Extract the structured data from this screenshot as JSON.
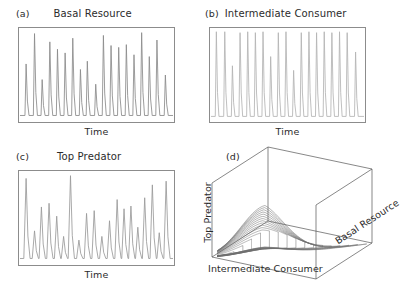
{
  "figure": {
    "background_color": "#ffffff",
    "frame_color": "#8c8c8c"
  },
  "panels": {
    "a": {
      "tag": "(a)",
      "title": "Basal Resource",
      "xlabel": "Time"
    },
    "b": {
      "tag": "(b)",
      "title": "Intermediate Consumer",
      "xlabel": "Time"
    },
    "c": {
      "tag": "(c)",
      "title": "Top Predator",
      "xlabel": "Time"
    },
    "d": {
      "tag": "(d)",
      "zlabel": "Top Predator",
      "xlabel": "Intermediate Consumer",
      "ylabel": "Basal Resource"
    }
  },
  "chart_data": [
    {
      "id": "panel-a",
      "type": "line",
      "title": "Basal Resource",
      "xlabel": "Time",
      "ylabel": "",
      "series_color": "#8a8a8a",
      "grid": false,
      "legend": "none",
      "xlim": [
        0,
        100
      ],
      "ylim": [
        0,
        1
      ],
      "description": "Chaotic spiky time series of basal resource density; narrow sharp peaks of varying height rising from a low flat baseline.",
      "peaks": [
        {
          "x": 4.0,
          "height": 0.62
        },
        {
          "x": 9.5,
          "height": 0.95
        },
        {
          "x": 14.5,
          "height": 0.45
        },
        {
          "x": 19.5,
          "height": 0.86
        },
        {
          "x": 24.5,
          "height": 0.78
        },
        {
          "x": 29.5,
          "height": 0.74
        },
        {
          "x": 34.5,
          "height": 0.9
        },
        {
          "x": 39.5,
          "height": 0.56
        },
        {
          "x": 44.0,
          "height": 0.65
        },
        {
          "x": 49.5,
          "height": 0.4
        },
        {
          "x": 54.5,
          "height": 0.93
        },
        {
          "x": 59.5,
          "height": 0.82
        },
        {
          "x": 64.5,
          "height": 0.8
        },
        {
          "x": 69.5,
          "height": 0.83
        },
        {
          "x": 74.5,
          "height": 0.72
        },
        {
          "x": 79.5,
          "height": 0.96
        },
        {
          "x": 84.5,
          "height": 0.7
        },
        {
          "x": 89.5,
          "height": 0.88
        },
        {
          "x": 95.0,
          "height": 0.5
        }
      ],
      "baseline": 0.06
    },
    {
      "id": "panel-b",
      "type": "line",
      "title": "Intermediate Consumer",
      "xlabel": "Time",
      "ylabel": "",
      "series_color": "#b4b4b4",
      "grid": false,
      "legend": "none",
      "xlim": [
        0,
        100
      ],
      "ylim": [
        0,
        1
      ],
      "description": "Chaotic time series of intermediate consumer density; tall near-uniform narrow spikes with occasional shorter spikes, low flat baseline.",
      "peaks": [
        {
          "x": 3.5,
          "height": 0.97
        },
        {
          "x": 9.0,
          "height": 0.97
        },
        {
          "x": 14.0,
          "height": 0.6
        },
        {
          "x": 19.0,
          "height": 0.96
        },
        {
          "x": 24.0,
          "height": 0.97
        },
        {
          "x": 29.0,
          "height": 0.96
        },
        {
          "x": 34.0,
          "height": 0.97
        },
        {
          "x": 39.0,
          "height": 0.7
        },
        {
          "x": 44.0,
          "height": 0.96
        },
        {
          "x": 49.0,
          "height": 0.97
        },
        {
          "x": 54.0,
          "height": 0.55
        },
        {
          "x": 59.0,
          "height": 0.96
        },
        {
          "x": 64.0,
          "height": 0.97
        },
        {
          "x": 69.0,
          "height": 0.96
        },
        {
          "x": 74.0,
          "height": 0.97
        },
        {
          "x": 79.0,
          "height": 0.96
        },
        {
          "x": 84.0,
          "height": 0.97
        },
        {
          "x": 89.0,
          "height": 0.96
        },
        {
          "x": 94.5,
          "height": 0.75
        }
      ],
      "baseline": 0.05
    },
    {
      "id": "panel-c",
      "type": "line",
      "title": "Top Predator",
      "xlabel": "Time",
      "ylabel": "",
      "series_color": "#9a9a9a",
      "grid": false,
      "legend": "none",
      "xlim": [
        0,
        100
      ],
      "ylim": [
        0,
        1
      ],
      "description": "Chaotic time series of top predator density; broader triangular peaks with strongly irregular amplitudes on a low baseline.",
      "peaks": [
        {
          "x": 4.0,
          "height": 0.93
        },
        {
          "x": 9.5,
          "height": 0.36
        },
        {
          "x": 14.0,
          "height": 0.62
        },
        {
          "x": 19.0,
          "height": 0.66
        },
        {
          "x": 24.0,
          "height": 0.52
        },
        {
          "x": 28.5,
          "height": 0.3
        },
        {
          "x": 33.0,
          "height": 0.96
        },
        {
          "x": 38.5,
          "height": 0.26
        },
        {
          "x": 43.5,
          "height": 0.55
        },
        {
          "x": 48.5,
          "height": 0.58
        },
        {
          "x": 53.5,
          "height": 0.3
        },
        {
          "x": 58.5,
          "height": 0.47
        },
        {
          "x": 63.5,
          "height": 0.7
        },
        {
          "x": 68.0,
          "height": 0.6
        },
        {
          "x": 72.5,
          "height": 0.63
        },
        {
          "x": 77.0,
          "height": 0.4
        },
        {
          "x": 81.5,
          "height": 0.72
        },
        {
          "x": 86.5,
          "height": 0.86
        },
        {
          "x": 91.0,
          "height": 0.34
        },
        {
          "x": 95.5,
          "height": 0.9
        }
      ],
      "baseline": 0.06
    },
    {
      "id": "panel-d",
      "type": "line",
      "title": "",
      "projection": "3d",
      "xlabel": "Intermediate Consumer",
      "ylabel": "Basal Resource",
      "zlabel": "Top Predator",
      "series_color": "#6e6e6e",
      "grid": false,
      "legend": "none",
      "description": "Three-dimensional phase-space plot of the tri-trophic food chain attractor, drawn as a wireframe box containing a family of nested teardrop-shaped orbits that rise into a sharp folded crest (teacup-and-saucer chaotic attractor).",
      "orbit_count": 16
    }
  ]
}
